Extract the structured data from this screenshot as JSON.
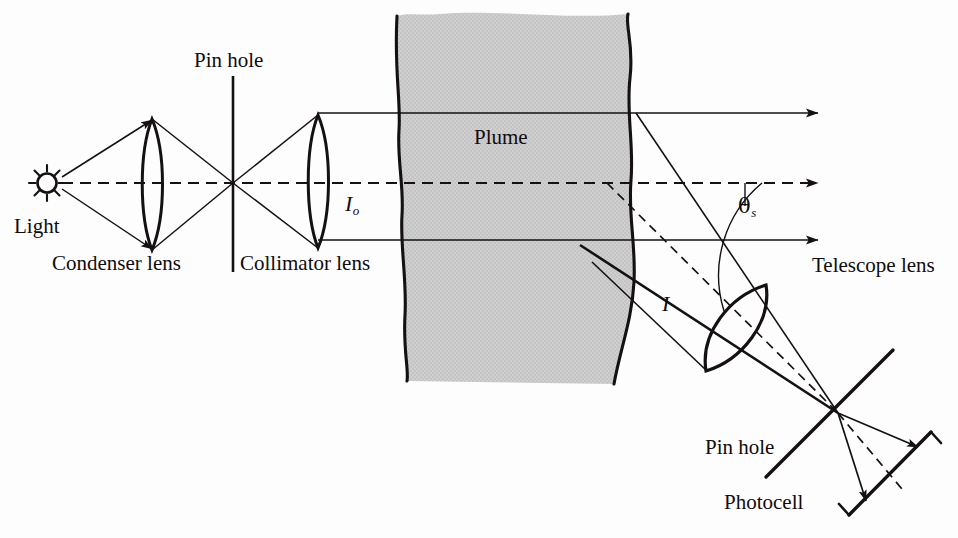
{
  "figure": {
    "background_color": "#fdfdfd",
    "line_color": "#151111",
    "plume_fill_color": "#cccccc"
  },
  "labels": {
    "light": "Light",
    "condenser_lens": "Condenser lens",
    "pin_hole_top": "Pin hole",
    "collimator_lens": "Collimator lens",
    "incident_intensity": "I",
    "incident_intensity_sub": "o",
    "plume": "Plume",
    "scattered_intensity": "I",
    "scattering_angle": "θ",
    "scattering_angle_sub": "s",
    "telescope_lens": "Telescope lens",
    "pin_hole_bottom": "Pin hole",
    "photocell": "Photocell"
  },
  "label_positions": {
    "light": {
      "x": 14,
      "y": 216
    },
    "condenser_lens": {
      "x": 52,
      "y": 253
    },
    "pin_hole_top": {
      "x": 194,
      "y": 50
    },
    "collimator_lens": {
      "x": 240,
      "y": 253
    },
    "incident_intensity": {
      "x": 345,
      "y": 193
    },
    "plume": {
      "x": 474,
      "y": 127
    },
    "scattered_intensity": {
      "x": 662,
      "y": 293
    },
    "scattering_angle": {
      "x": 738,
      "y": 196
    },
    "telescope_lens": {
      "x": 812,
      "y": 255
    },
    "pin_hole_bottom": {
      "x": 705,
      "y": 437
    },
    "photocell": {
      "x": 724,
      "y": 492
    }
  },
  "components": {
    "light_source": {
      "cx": 47,
      "cy": 183,
      "r": 9,
      "rays": 8,
      "type": "sun-icon"
    },
    "condenser_lens": {
      "cx": 152,
      "top_y": 119,
      "bottom_y": 250,
      "bulge": 15
    },
    "pin_hole_aperture_1": {
      "x": 233,
      "top_y": 76,
      "bottom_y": 272
    },
    "collimator_lens": {
      "cx": 318,
      "top_y": 115,
      "bottom_y": 248,
      "bulge": 15
    },
    "focal_point_1": {
      "x": 233,
      "y": 183
    },
    "plume_region": {
      "left_x": 400,
      "right_x": 637,
      "top_y": 12,
      "bottom_y": 383
    },
    "telescope_lens": {
      "p1_x": 765,
      "p1_y": 285,
      "p2_x": 705,
      "p2_y": 370,
      "bulge": 27
    },
    "pin_hole_aperture_2": {
      "x1": 768,
      "y1": 475,
      "x2": 890,
      "y2": 352
    },
    "focal_point_2": {
      "x": 838,
      "y": 413
    },
    "photocell": {
      "x1": 843,
      "y1": 512,
      "x2": 928,
      "y2": 432
    }
  },
  "beams": {
    "optical_axis_y": 183,
    "upper_beam_y": 113,
    "lower_beam_y": 240,
    "axis_style": "dashed",
    "beam_style": "solid",
    "arrow_end_x": 820
  },
  "rays": {
    "source_to_condenser": [
      {
        "x1": 60,
        "y1": 178,
        "x2": 152,
        "y2": 119
      },
      {
        "x1": 60,
        "y1": 190,
        "x2": 152,
        "y2": 250
      }
    ],
    "condenser_to_pinhole": [
      {
        "x1": 152,
        "y1": 119,
        "x2": 233,
        "y2": 183
      },
      {
        "x1": 152,
        "y1": 250,
        "x2": 233,
        "y2": 183
      }
    ],
    "pinhole_to_collimator": [
      {
        "x1": 233,
        "y1": 183,
        "x2": 318,
        "y2": 115
      },
      {
        "x1": 233,
        "y1": 183,
        "x2": 318,
        "y2": 248
      }
    ],
    "scattered_upper": {
      "x1": 636,
      "y1": 113,
      "x2": 838,
      "y2": 413
    },
    "scattered_axis_dashed": {
      "x1": 607,
      "y1": 183,
      "x2": 838,
      "y2": 413
    },
    "scattered_lower": {
      "x1": 580,
      "y1": 245,
      "x2": 838,
      "y2": 413
    },
    "scattered_lowest": {
      "x1": 592,
      "y1": 262,
      "x2": 705,
      "y2": 370
    },
    "output_upper": {
      "x1": 838,
      "y1": 413,
      "x2": 922,
      "y2": 449
    },
    "output_lower": {
      "x1": 838,
      "y1": 413,
      "x2": 868,
      "y2": 505
    },
    "output_dashed": {
      "x1": 838,
      "y1": 413,
      "x2": 900,
      "y2": 487
    }
  },
  "angle_arc": {
    "vertex_x": 762,
    "vertex_y": 183,
    "radius": 120,
    "leader_from": {
      "x": 745,
      "y": 183
    },
    "leader_to": {
      "x": 745,
      "y": 206
    }
  }
}
